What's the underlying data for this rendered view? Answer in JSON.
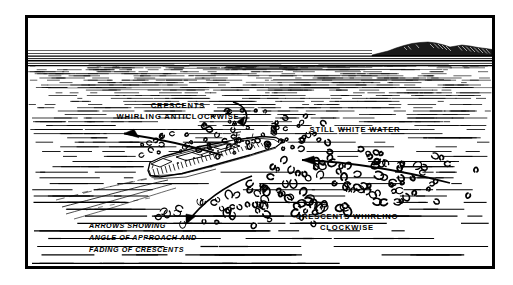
{
  "figure": {
    "background_color": "#ffffff",
    "ink_color": "#000000",
    "frame": {
      "name": "illustration-border",
      "x": 25,
      "y": 15,
      "width": 470,
      "height": 254,
      "stroke_width": 3
    },
    "scene": {
      "horizon_y": 57,
      "sky_color": "#ffffff",
      "sea_color": "#ffffff",
      "landmass": {
        "name": "distant-headland",
        "description": "dark hatched hills on right horizon",
        "x_start": 372,
        "x_end": 495,
        "peak_y": 42
      },
      "vessel": {
        "name": "warship",
        "description": "naval vessel seen from astern-port quarter, bow to upper right",
        "center_x": 208,
        "center_y": 162,
        "length": 130
      }
    },
    "labels": [
      {
        "id": "anticlockwise",
        "name": "label-crescents-anticlockwise",
        "lines": [
          "CRESCENTS",
          "WHIRLING ANTICLOCKWISE"
        ],
        "x": 178,
        "y": 108,
        "anchor": "middle",
        "style": "upright"
      },
      {
        "id": "still-water",
        "name": "label-still-white-water",
        "lines": [
          "STILL WHITE WATER"
        ],
        "x": 355,
        "y": 132,
        "anchor": "middle",
        "style": "upright"
      },
      {
        "id": "clockwise",
        "name": "label-crescents-clockwise",
        "lines": [
          "CRESCENTS  WHIRLING",
          "CLOCKWISE"
        ],
        "x": 347,
        "y": 219,
        "anchor": "middle",
        "style": "upright"
      },
      {
        "id": "arrows-caption",
        "name": "caption-arrows-explanation",
        "lines": [
          "ARROWS SHOWING",
          "ANGLE OF APPROACH AND",
          "FADING OF CRESCENTS"
        ],
        "x": 89,
        "y": 228,
        "anchor": "start",
        "style": "italic"
      }
    ],
    "arrows": [
      {
        "id": "arrow-anticlockwise-sweep",
        "name": "arrow-anticlockwise-sweep",
        "description": "long curved arrow sweeping left across the port side wake"
      },
      {
        "id": "arrow-anticlockwise-pointer",
        "name": "arrow-anticlockwise-pointer",
        "description": "short hooked arrow from anticlockwise label down to crescent field"
      },
      {
        "id": "arrow-clockwise-sweep",
        "name": "arrow-clockwise-sweep",
        "description": "long arrow entering from right pointing left toward the vessel"
      },
      {
        "id": "arrow-fading-crescents",
        "name": "arrow-fading-crescents",
        "description": "curved arrow sweeping down-left toward the italic caption"
      }
    ]
  }
}
